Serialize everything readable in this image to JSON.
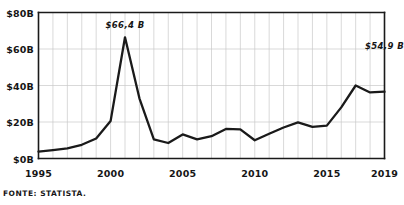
{
  "chart_data": {
    "type": "line",
    "title": "",
    "subtitle": "",
    "xlabel": "",
    "ylabel": "",
    "xlim": [
      1995,
      2019
    ],
    "ylim": [
      0,
      80
    ],
    "grid": true,
    "legend_position": "none",
    "y_ticks": [
      {
        "value": 0,
        "label": "$0B"
      },
      {
        "value": 20,
        "label": "$20B"
      },
      {
        "value": 40,
        "label": "$40B"
      },
      {
        "value": 60,
        "label": "$60B"
      },
      {
        "value": 80,
        "label": "$80B"
      }
    ],
    "x_ticks": [
      {
        "value": 1995,
        "label": "1995"
      },
      {
        "value": 2000,
        "label": "2000"
      },
      {
        "value": 2005,
        "label": "2005"
      },
      {
        "value": 2010,
        "label": "2010"
      },
      {
        "value": 2015,
        "label": "2015"
      },
      {
        "value": 2019,
        "label": "2019"
      }
    ],
    "x": [
      1995,
      1996,
      1997,
      1998,
      1999,
      2000,
      2001,
      2002,
      2003,
      2004,
      2005,
      2006,
      2007,
      2008,
      2009,
      2010,
      2011,
      2012,
      2013,
      2014,
      2015,
      2016,
      2017,
      2018,
      2019
    ],
    "values": [
      3.8,
      4.6,
      5.5,
      7.5,
      11.0,
      20.5,
      66.4,
      33.0,
      10.5,
      8.5,
      13.2,
      10.5,
      12.2,
      16.2,
      16.0,
      10.0,
      13.6,
      17.0,
      19.8,
      17.3,
      18.0,
      28.0,
      40.0,
      36.2,
      36.6
    ],
    "series": [
      {
        "name": "value",
        "values": [
          3.8,
          4.6,
          5.5,
          7.5,
          11.0,
          20.5,
          66.4,
          33.0,
          10.5,
          8.5,
          13.2,
          10.5,
          12.2,
          16.2,
          16.0,
          10.0,
          13.6,
          17.0,
          19.8,
          17.3,
          18.0,
          28.0,
          40.0,
          36.2,
          36.6
        ]
      }
    ],
    "annotations": [
      {
        "name": "peak-annotation",
        "text": "$66,4 B",
        "x": 2001,
        "y": 66.4
      },
      {
        "name": "end-annotation",
        "text": "$54,9 B",
        "x": 2019,
        "y": 54.9
      }
    ],
    "line_color": "#1a1a1a",
    "grid_color": "#c9c9c9",
    "axis_color": "#1a1a1a",
    "background_color": "#ffffff"
  },
  "source": {
    "label": "FONTE: STATISTA."
  }
}
